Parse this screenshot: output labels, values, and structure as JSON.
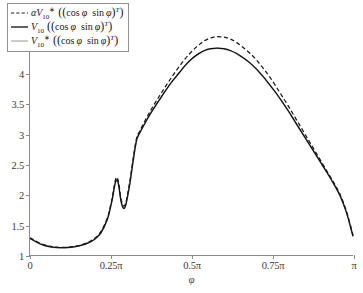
{
  "chart_data": {
    "type": "line",
    "title": "",
    "xlabel": "φ",
    "ylabel": "",
    "xlim": [
      0,
      3.14159265
    ],
    "ylim": [
      1,
      5
    ],
    "grid": false,
    "legend_position": "top-left",
    "x_tick_labels": [
      "0",
      "0.25π",
      "0.5π",
      "0.75π",
      "π"
    ],
    "x_tick_values": [
      0,
      0.25,
      0.5,
      0.75,
      1.0
    ],
    "y_tick_labels": [
      "1",
      "1.5",
      "2",
      "2.5",
      "3",
      "3.5",
      "4",
      "4.5",
      "5"
    ],
    "y_tick_values": [
      1,
      1.5,
      2,
      2.5,
      3,
      3.5,
      4,
      4.5,
      5
    ],
    "series": [
      {
        "name": "alpha_V10_star",
        "legend_label": "αV₁₀* ((cos φ  sin φ)ᵀ)",
        "style": "dashed",
        "color": "#1a1a1a",
        "x": [
          0.0,
          0.02,
          0.04,
          0.06,
          0.08,
          0.1,
          0.12,
          0.14,
          0.16,
          0.18,
          0.2,
          0.22,
          0.24,
          0.25,
          0.255,
          0.26,
          0.265,
          0.27,
          0.275,
          0.28,
          0.285,
          0.29,
          0.295,
          0.3,
          0.31,
          0.32,
          0.33,
          0.34,
          0.36,
          0.38,
          0.4,
          0.42,
          0.44,
          0.46,
          0.48,
          0.5,
          0.52,
          0.54,
          0.56,
          0.58,
          0.6,
          0.62,
          0.64,
          0.66,
          0.68,
          0.7,
          0.72,
          0.74,
          0.76,
          0.78,
          0.8,
          0.82,
          0.84,
          0.86,
          0.88,
          0.9,
          0.92,
          0.94,
          0.96,
          0.98,
          1.0
        ],
        "values": [
          1.285,
          1.225,
          1.175,
          1.145,
          1.13,
          1.125,
          1.13,
          1.145,
          1.17,
          1.21,
          1.275,
          1.39,
          1.62,
          1.83,
          1.96,
          2.12,
          2.25,
          2.28,
          2.18,
          1.99,
          1.86,
          1.81,
          1.84,
          1.95,
          2.25,
          2.62,
          2.93,
          3.05,
          3.26,
          3.45,
          3.62,
          3.79,
          3.95,
          4.1,
          4.24,
          4.36,
          4.46,
          4.54,
          4.59,
          4.61,
          4.6,
          4.57,
          4.51,
          4.43,
          4.34,
          4.23,
          4.1,
          3.96,
          3.8,
          3.63,
          3.46,
          3.28,
          3.1,
          2.92,
          2.74,
          2.56,
          2.38,
          2.2,
          2.0,
          1.72,
          1.33
        ]
      },
      {
        "name": "V10",
        "legend_label": "V₁₀ ((cos φ  sin φ)ᵀ)",
        "style": "solid",
        "color": "#0f0f0f",
        "x": [
          0.0,
          0.02,
          0.04,
          0.06,
          0.08,
          0.1,
          0.12,
          0.14,
          0.16,
          0.18,
          0.2,
          0.22,
          0.24,
          0.25,
          0.255,
          0.26,
          0.265,
          0.27,
          0.275,
          0.28,
          0.285,
          0.29,
          0.295,
          0.3,
          0.31,
          0.32,
          0.33,
          0.34,
          0.36,
          0.38,
          0.4,
          0.42,
          0.44,
          0.46,
          0.48,
          0.5,
          0.52,
          0.54,
          0.56,
          0.58,
          0.6,
          0.62,
          0.64,
          0.66,
          0.68,
          0.7,
          0.72,
          0.74,
          0.76,
          0.78,
          0.8,
          0.82,
          0.84,
          0.86,
          0.88,
          0.9,
          0.92,
          0.94,
          0.96,
          0.98,
          1.0
        ],
        "values": [
          1.275,
          1.215,
          1.168,
          1.14,
          1.125,
          1.12,
          1.125,
          1.14,
          1.163,
          1.2,
          1.26,
          1.37,
          1.6,
          1.81,
          1.93,
          2.09,
          2.21,
          2.24,
          2.14,
          1.95,
          1.82,
          1.77,
          1.8,
          1.91,
          2.21,
          2.58,
          2.9,
          3.02,
          3.22,
          3.4,
          3.56,
          3.72,
          3.87,
          4.0,
          4.13,
          4.24,
          4.32,
          4.38,
          4.41,
          4.42,
          4.41,
          4.38,
          4.33,
          4.26,
          4.18,
          4.08,
          3.96,
          3.83,
          3.69,
          3.54,
          3.38,
          3.21,
          3.04,
          2.87,
          2.7,
          2.53,
          2.36,
          2.18,
          1.98,
          1.7,
          1.31
        ]
      },
      {
        "name": "V10_star",
        "legend_label": "V₁₀* ((cos φ  sin φ)ᵀ)",
        "style": "solid-light",
        "color": "#b4b4b4",
        "x": [
          0.0,
          0.02,
          0.04,
          0.06,
          0.08,
          0.1,
          0.12,
          0.14,
          0.16,
          0.18,
          0.2,
          0.22,
          0.24,
          0.25,
          0.255,
          0.26,
          0.265,
          0.27,
          0.275,
          0.28,
          0.285,
          0.29,
          0.295,
          0.3,
          0.31,
          0.32,
          0.33,
          0.34,
          0.36,
          0.38,
          0.4,
          0.42,
          0.44,
          0.46,
          0.48,
          0.5,
          0.52,
          0.54,
          0.56,
          0.58,
          0.6,
          0.62,
          0.64,
          0.66,
          0.68,
          0.7,
          0.72,
          0.74,
          0.76,
          0.78,
          0.8,
          0.82,
          0.84,
          0.86,
          0.88,
          0.9,
          0.92,
          0.94,
          0.96,
          0.98,
          1.0
        ],
        "values": [
          1.272,
          1.212,
          1.165,
          1.137,
          1.122,
          1.117,
          1.122,
          1.137,
          1.16,
          1.197,
          1.257,
          1.367,
          1.597,
          1.807,
          1.927,
          2.087,
          2.207,
          2.237,
          2.137,
          1.947,
          1.817,
          1.767,
          1.797,
          1.907,
          2.207,
          2.577,
          2.897,
          3.017,
          3.217,
          3.397,
          3.557,
          3.717,
          3.867,
          3.997,
          4.127,
          4.237,
          4.317,
          4.377,
          4.407,
          4.417,
          4.407,
          4.377,
          4.327,
          4.257,
          4.177,
          4.077,
          3.957,
          3.827,
          3.687,
          3.537,
          3.377,
          3.207,
          3.037,
          2.867,
          2.697,
          2.527,
          2.357,
          2.177,
          1.977,
          1.697,
          1.307
        ]
      }
    ]
  },
  "legend": {
    "entries": [
      {
        "id": "legend-entry-alpha-v10-star",
        "style": "dashed",
        "prefix": "α",
        "symbol": "V",
        "subscript": "10",
        "superscript": "∗",
        "argument": "((cos φ  sin φ)",
        "arg_sup": "T",
        "arg_close": ")"
      },
      {
        "id": "legend-entry-v10",
        "style": "solid",
        "prefix": "",
        "symbol": "V",
        "subscript": "10",
        "superscript": "",
        "argument": "((cos φ  sin φ)",
        "arg_sup": "T",
        "arg_close": ")"
      },
      {
        "id": "legend-entry-v10-star",
        "style": "solid-light",
        "prefix": "",
        "symbol": "V",
        "subscript": "10",
        "superscript": "∗",
        "argument": "((cos φ  sin φ)",
        "arg_sup": "T",
        "arg_close": ")"
      }
    ]
  },
  "axes": {
    "x_title": "φ",
    "x_labels": [
      "0",
      "0.25π",
      "0.5π",
      "0.75π",
      "π"
    ],
    "y_labels": [
      "5",
      "4.5",
      "4",
      "3.5",
      "3",
      "2.5",
      "2",
      "1.5",
      "1"
    ]
  },
  "colors": {
    "axis": "#8a8a8a",
    "solid_curve": "#0f0f0f",
    "dashed_curve": "#1a1a1a",
    "light_curve": "#b4b4b4",
    "background": "#ffffff",
    "text": "#3b3b3b"
  }
}
